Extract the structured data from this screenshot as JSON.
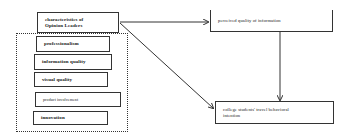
{
  "diagram": {
    "source_box": {
      "label": "characteristics of Opinion Leaders",
      "line1": "characteristics of",
      "line2": "Opinion Leaders"
    },
    "factors": [
      {
        "label": "professionalism"
      },
      {
        "label": "information quality"
      },
      {
        "label": "visual quality"
      },
      {
        "label": "product involvement"
      },
      {
        "label": "innovation"
      }
    ],
    "mediator": {
      "label": "perceived quality of information"
    },
    "outcome": {
      "label": "college students' travel behavioral intention",
      "line1": "college students' travel behavioral",
      "line2": "intention"
    },
    "edges": [
      {
        "from": "characteristics of Opinion Leaders",
        "to": "perceived quality of information"
      },
      {
        "from": "characteristics of Opinion Leaders",
        "to": "college students' travel behavioral intention"
      },
      {
        "from": "perceived quality of information",
        "to": "college students' travel behavioral intention"
      }
    ],
    "colors": {
      "line": "#333333",
      "background": "#ffffff"
    }
  }
}
